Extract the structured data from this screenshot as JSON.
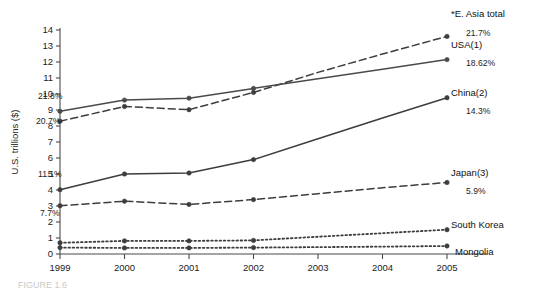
{
  "chart_data": {
    "type": "line",
    "title": "",
    "xlabel": "",
    "ylabel": "U.S. trillions ($)",
    "x": [
      1999,
      2000,
      2001,
      2002,
      2003,
      2004,
      2005
    ],
    "xtick_labels": [
      "1999",
      "2000",
      "2001",
      "2002",
      "2003",
      "2004",
      "2005"
    ],
    "ytick_labels": [
      "0",
      "1",
      "2",
      "3",
      "4",
      "5",
      "6",
      "7",
      "8",
      "9",
      "10",
      "11",
      "12",
      "13",
      "14"
    ],
    "ylim": [
      0,
      14
    ],
    "grid": false,
    "legend_position": "right-inline",
    "marker_years": [
      1999,
      2000,
      2001,
      2002,
      2005
    ],
    "series": [
      {
        "name": "*E. Asia total",
        "label": "*E. Asia total",
        "value_label": "21.7%",
        "style": "dashed",
        "color": "#3d3d3d",
        "values": [
          8.3,
          9.22,
          9.02,
          10.1,
          11.35,
          12.5,
          13.6
        ],
        "start_annotation": "20.7%"
      },
      {
        "name": "USA(1)",
        "label": "USA(1)",
        "value_label": "18.62%",
        "style": "solid",
        "color": "#4a4a4a",
        "values": [
          8.92,
          9.62,
          9.74,
          10.35,
          10.95,
          11.55,
          12.15
        ],
        "start_annotation": "21.8%"
      },
      {
        "name": "China(2)",
        "label": "China(2)",
        "value_label": "14.3%",
        "style": "solid",
        "color": "#3d3d3d",
        "values": [
          4.02,
          5.0,
          5.06,
          5.9,
          7.2,
          8.5,
          9.77
        ],
        "start_annotation": "11.1%"
      },
      {
        "name": "Japan(3)",
        "label": "Japan(3)",
        "value_label": "5.9%",
        "style": "dashed",
        "color": "#3d3d3d",
        "values": [
          3.02,
          3.3,
          3.1,
          3.4,
          3.77,
          4.14,
          4.47
        ],
        "start_annotation": "7.7%"
      },
      {
        "name": "South Korea",
        "label": "South Korea",
        "value_label": "",
        "style": "dotted",
        "color": "#3d3d3d",
        "values": [
          0.7,
          0.82,
          0.82,
          0.85,
          1.08,
          1.3,
          1.52
        ],
        "start_annotation": ""
      },
      {
        "name": "Mongolia",
        "label": "Mongolia",
        "value_label": "",
        "style": "dotted",
        "color": "#3d3d3d",
        "values": [
          0.4,
          0.38,
          0.38,
          0.4,
          0.43,
          0.46,
          0.5
        ],
        "start_annotation": ""
      }
    ]
  },
  "caption": {
    "text": "FIGURE 1.6"
  }
}
